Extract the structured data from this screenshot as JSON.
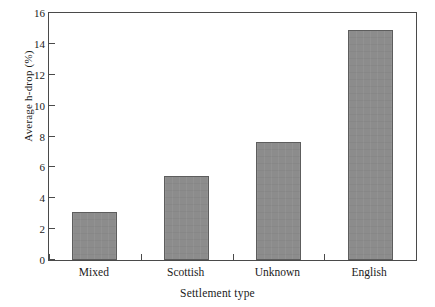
{
  "chart_data": {
    "type": "bar",
    "title": "",
    "xlabel": "Settlement type",
    "ylabel": "Average h-drop (%)",
    "categories": [
      "Mixed",
      "Scottish",
      "Unknown",
      "English"
    ],
    "values": [
      3.1,
      5.45,
      7.65,
      14.9
    ],
    "ylim": [
      0,
      16
    ],
    "ytick_step": 2,
    "yticks": [
      0,
      2,
      4,
      6,
      8,
      10,
      12,
      14,
      16
    ],
    "ytick_labels": [
      "0",
      "2",
      "4",
      "6",
      "8",
      "10",
      "12",
      "14",
      "16"
    ],
    "grid": false,
    "legend": null,
    "bar_color": "#8c8c8c",
    "bar_edge_color": "#5d5d5d",
    "axis_color": "#4a4a4a",
    "background": "#ffffff"
  }
}
